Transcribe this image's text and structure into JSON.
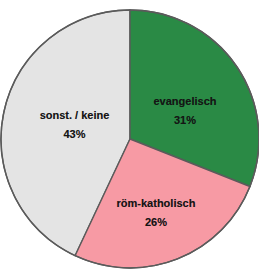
{
  "chart_data": {
    "type": "pie",
    "title": "",
    "subtitle": "",
    "xlabel": "",
    "ylabel": "",
    "legend_position": "none",
    "grid": false,
    "labels_inside_slices": true,
    "start_angle_deg": 0,
    "direction": "clockwise",
    "categories": [
      "evangelisch",
      "röm-katholisch",
      "sonst. / keine"
    ],
    "values": [
      31,
      26,
      43
    ],
    "value_unit": "%",
    "slices": [
      {
        "label": "evangelisch",
        "value": 31,
        "value_label": "31%",
        "color": "#2a8a45",
        "start_angle_deg": 0,
        "end_angle_deg": 111.6
      },
      {
        "label": "röm-katholisch",
        "value": 26,
        "value_label": "26%",
        "color": "#f79aa4",
        "start_angle_deg": 111.6,
        "end_angle_deg": 205.2
      },
      {
        "label": "sonst. / keine",
        "value": 43,
        "value_label": "43%",
        "color": "#e4e4e4",
        "start_angle_deg": 205.2,
        "end_angle_deg": 360
      }
    ]
  },
  "colors": {
    "background": "#ffffff",
    "outline": "#5b5b5b",
    "divider": "#6a6a6a",
    "evangelisch": "#2a8a45",
    "roem_katholisch": "#f79aa4",
    "sonstige_keine": "#e4e4e4",
    "label_text": "#151515"
  },
  "geometry": {
    "center_x": 130,
    "center_y": 139,
    "radius": 129
  },
  "labels": {
    "evangelisch": {
      "name": "evangelisch",
      "value": "31%"
    },
    "roem_katholisch": {
      "name": "röm-katholisch",
      "value": "26%"
    },
    "sonstige_keine": {
      "name": "sonst. / keine",
      "value": "43%"
    }
  }
}
